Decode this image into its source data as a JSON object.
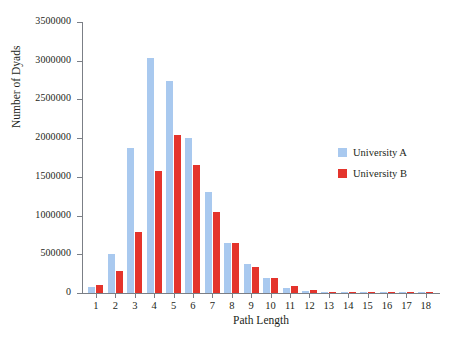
{
  "chart_data": {
    "type": "bar",
    "title": "",
    "xlabel": "Path Length",
    "ylabel": "Number of Dyads",
    "categories": [
      "1",
      "2",
      "3",
      "4",
      "5",
      "6",
      "7",
      "8",
      "9",
      "10",
      "11",
      "12",
      "13",
      "14",
      "15",
      "16",
      "17",
      "18"
    ],
    "series": [
      {
        "name": "University A",
        "color": "#a9c9ef",
        "values": [
          75000,
          500000,
          1870000,
          3030000,
          2740000,
          2000000,
          1300000,
          640000,
          370000,
          190000,
          70000,
          25000,
          9000,
          4000,
          2000,
          1000,
          500,
          200
        ]
      },
      {
        "name": "University B",
        "color": "#e4342c",
        "values": [
          100000,
          285000,
          790000,
          1570000,
          2040000,
          1650000,
          1050000,
          650000,
          340000,
          200000,
          95000,
          35000,
          12000,
          5000,
          2500,
          1200,
          600,
          300
        ]
      }
    ],
    "ylim": [
      0,
      3500000
    ],
    "yticks": [
      0,
      500000,
      1000000,
      1500000,
      2000000,
      2500000,
      3000000,
      3500000
    ],
    "ytick_labels": [
      "0",
      "500000",
      "1000000",
      "1500000",
      "2000000",
      "2500000",
      "3000000",
      "3500000"
    ],
    "grid": false,
    "legend_position": "right-center"
  },
  "legend": {
    "items": [
      {
        "label": "University A",
        "swatch": "series-a"
      },
      {
        "label": "University B",
        "swatch": "series-b"
      }
    ]
  }
}
